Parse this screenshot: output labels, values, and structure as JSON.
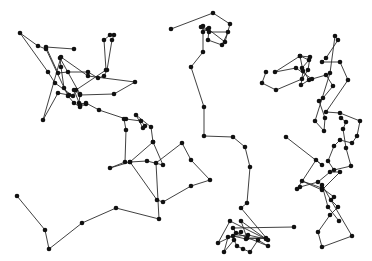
{
  "canvas": {
    "width": 372,
    "height": 261,
    "background": "#ffffff"
  },
  "style": {
    "line_color": "#2b2b2b",
    "node_color": "#111111",
    "node_radius": 2.3
  },
  "paths": [
    {
      "name": "left-cluster",
      "points": [
        [
          74,
          49
        ],
        [
          46,
          47
        ],
        [
          58,
          73
        ],
        [
          68,
          72
        ],
        [
          88,
          72
        ],
        [
          98,
          78
        ],
        [
          104,
          76
        ],
        [
          107,
          70
        ],
        [
          112,
          40
        ],
        [
          114,
          35
        ],
        [
          110,
          35
        ],
        [
          104,
          40
        ],
        [
          106,
          70
        ],
        [
          76,
          90
        ],
        [
          73,
          96
        ],
        [
          55,
          83
        ],
        [
          48,
          72
        ],
        [
          20,
          33
        ],
        [
          38,
          46
        ],
        [
          46,
          49
        ],
        [
          68,
          96
        ],
        [
          74,
          103
        ],
        [
          80,
          107
        ],
        [
          86,
          104
        ],
        [
          79,
          103
        ],
        [
          80,
          94
        ],
        [
          60,
          58
        ],
        [
          61,
          67
        ],
        [
          64,
          88
        ],
        [
          69,
          95
        ],
        [
          58,
          93
        ],
        [
          43,
          120
        ],
        [
          61,
          57
        ],
        [
          88,
          76
        ],
        [
          135,
          82
        ],
        [
          114,
          94
        ],
        [
          80,
          95
        ],
        [
          74,
          90
        ],
        [
          80,
          105
        ],
        [
          86,
          103
        ],
        [
          99,
          110
        ],
        [
          126,
          119
        ],
        [
          141,
          121
        ],
        [
          145,
          126
        ],
        [
          143,
          128
        ],
        [
          136,
          115
        ],
        [
          151,
          127
        ],
        [
          153,
          142
        ],
        [
          130,
          162
        ],
        [
          110,
          168
        ],
        [
          125,
          162
        ],
        [
          126,
          130
        ],
        [
          124,
          119
        ]
      ]
    },
    {
      "name": "left-bottom",
      "points": [
        [
          17,
          196
        ],
        [
          45,
          230
        ],
        [
          49,
          249
        ],
        [
          82,
          223
        ],
        [
          116,
          208
        ],
        [
          159,
          219
        ],
        [
          156,
          163
        ],
        [
          182,
          143
        ],
        [
          191,
          160
        ],
        [
          210,
          180
        ],
        [
          191,
          186
        ],
        [
          163,
          202
        ],
        [
          157,
          200
        ],
        [
          130,
          162
        ],
        [
          147,
          161
        ],
        [
          163,
          165
        ],
        [
          153,
          142
        ]
      ]
    },
    {
      "name": "center-vertical",
      "points": [
        [
          171,
          29
        ],
        [
          213,
          13
        ],
        [
          230,
          24
        ],
        [
          225,
          42
        ],
        [
          208,
          29
        ],
        [
          201,
          27
        ],
        [
          209,
          32
        ],
        [
          228,
          32
        ],
        [
          222,
          45
        ],
        [
          208,
          40
        ],
        [
          209,
          28
        ],
        [
          203,
          32
        ],
        [
          203,
          26
        ],
        [
          203,
          52
        ],
        [
          191,
          67
        ],
        [
          204,
          107
        ],
        [
          204,
          136
        ],
        [
          233,
          137
        ],
        [
          245,
          147
        ],
        [
          250,
          167
        ],
        [
          247,
          203
        ],
        [
          241,
          208
        ],
        [
          268,
          240
        ],
        [
          230,
          221
        ],
        [
          218,
          243
        ],
        [
          241,
          232
        ],
        [
          233,
          236
        ],
        [
          246,
          239
        ],
        [
          266,
          238
        ],
        [
          247,
          238
        ],
        [
          241,
          221
        ],
        [
          266,
          239
        ],
        [
          248,
          235
        ],
        [
          228,
          237
        ],
        [
          224,
          252
        ],
        [
          234,
          240
        ],
        [
          237,
          246
        ],
        [
          243,
          249
        ],
        [
          250,
          252
        ],
        [
          258,
          240
        ],
        [
          268,
          246
        ],
        [
          236,
          233
        ],
        [
          233,
          228
        ],
        [
          294,
          227
        ]
      ]
    },
    {
      "name": "right-cluster",
      "points": [
        [
          266,
          72
        ],
        [
          262,
          83
        ],
        [
          276,
          90
        ],
        [
          302,
          79
        ],
        [
          308,
          70
        ],
        [
          310,
          57
        ],
        [
          300,
          56
        ],
        [
          303,
          71
        ],
        [
          301,
          85
        ],
        [
          309,
          80
        ],
        [
          302,
          68
        ],
        [
          309,
          60
        ],
        [
          300,
          56
        ],
        [
          275,
          72
        ],
        [
          296,
          68
        ],
        [
          312,
          79
        ],
        [
          326,
          75
        ],
        [
          333,
          86
        ],
        [
          323,
          98
        ],
        [
          319,
          101
        ],
        [
          325,
          118
        ],
        [
          324,
          131
        ],
        [
          315,
          121
        ],
        [
          330,
          73
        ],
        [
          335,
          36
        ],
        [
          338,
          40
        ],
        [
          326,
          58
        ],
        [
          322,
          62
        ],
        [
          340,
          62
        ],
        [
          348,
          80
        ],
        [
          326,
          112
        ],
        [
          340,
          113
        ],
        [
          360,
          121
        ],
        [
          357,
          136
        ],
        [
          352,
          143
        ],
        [
          340,
          140
        ],
        [
          334,
          146
        ],
        [
          328,
          161
        ],
        [
          334,
          170
        ],
        [
          351,
          166
        ],
        [
          346,
          148
        ],
        [
          343,
          129
        ],
        [
          346,
          122
        ],
        [
          341,
          118
        ]
      ]
    },
    {
      "name": "right-lower",
      "points": [
        [
          286,
          137
        ],
        [
          322,
          165
        ],
        [
          316,
          160
        ],
        [
          297,
          189
        ],
        [
          300,
          187
        ],
        [
          318,
          182
        ],
        [
          330,
          172
        ],
        [
          340,
          172
        ],
        [
          322,
          190
        ],
        [
          302,
          181
        ],
        [
          322,
          188
        ],
        [
          334,
          197
        ],
        [
          331,
          200
        ],
        [
          338,
          207
        ],
        [
          330,
          215
        ],
        [
          318,
          232
        ],
        [
          322,
          247
        ],
        [
          352,
          236
        ],
        [
          322,
          185
        ],
        [
          328,
          207
        ],
        [
          339,
          221
        ]
      ]
    }
  ]
}
